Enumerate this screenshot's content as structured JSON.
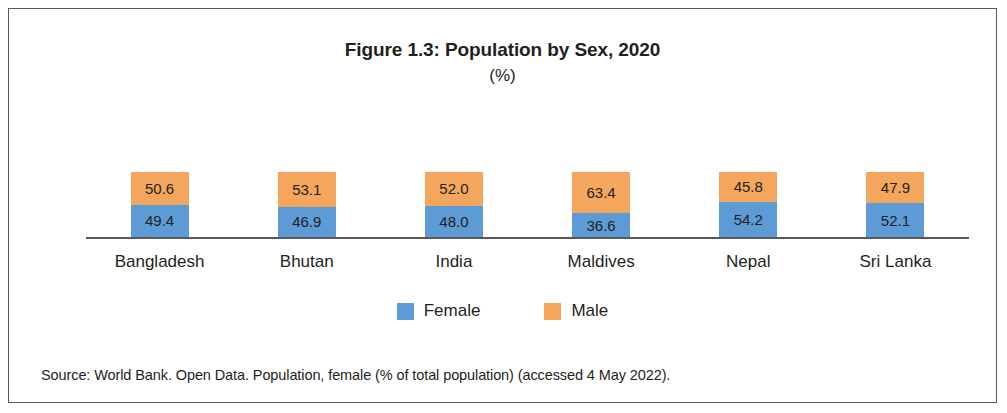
{
  "figure": {
    "title": "Figure 1.3: Population by Sex, 2020",
    "subtitle": "(%)",
    "source": "Source: World Bank. Open Data. Population, female (% of total population) (accessed 4 May 2022)."
  },
  "legend": {
    "items": [
      {
        "label": "Female",
        "color": "#5C9BD5"
      },
      {
        "label": "Male",
        "color": "#F4A75C"
      }
    ]
  },
  "chart_data": {
    "type": "bar",
    "subtype": "stacked-100-percent",
    "title": "Figure 1.3: Population by Sex, 2020",
    "subtitle": "(%)",
    "xlabel": "",
    "ylabel": "",
    "ylim": [
      0,
      100
    ],
    "grid": false,
    "legend_position": "bottom-center",
    "categories": [
      "Bangladesh",
      "Bhutan",
      "India",
      "Maldives",
      "Nepal",
      "Sri Lanka"
    ],
    "series": [
      {
        "name": "Male",
        "color": "#F4A75C",
        "values": [
          50.6,
          53.1,
          52.0,
          63.4,
          45.8,
          47.9
        ]
      },
      {
        "name": "Female",
        "color": "#5C9BD5",
        "values": [
          49.4,
          46.9,
          48.0,
          36.6,
          54.2,
          52.1
        ]
      }
    ],
    "value_labels": [
      {
        "category": "Bangladesh",
        "male": "50.6",
        "female": "49.4"
      },
      {
        "category": "Bhutan",
        "male": "53.1",
        "female": "46.9"
      },
      {
        "category": "India",
        "male": "52.0",
        "female": "48.0"
      },
      {
        "category": "Maldives",
        "male": "63.4",
        "female": "36.6"
      },
      {
        "category": "Nepal",
        "male": "45.8",
        "female": "54.2"
      },
      {
        "category": "Sri Lanka",
        "male": "47.9",
        "female": "52.1"
      }
    ]
  }
}
